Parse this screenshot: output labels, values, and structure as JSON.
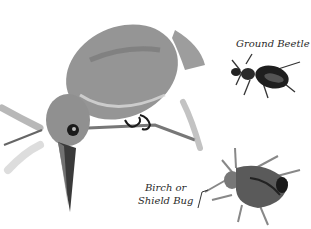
{
  "illustration": {
    "subjects": [
      "kingfisher-bird",
      "ground-beetle",
      "shield-bug"
    ],
    "style": "watercolor-grayscale"
  },
  "labels": {
    "ground_beetle": "Ground Beetle",
    "shield_bug_line1": "Birch or",
    "shield_bug_line2": "Shield Bug"
  },
  "colors": {
    "background": "#ffffff",
    "bird_body": "#8a8a8a",
    "bird_dark": "#555555",
    "ink": "#1a1a1a",
    "leaf": "#9a9a9a"
  }
}
